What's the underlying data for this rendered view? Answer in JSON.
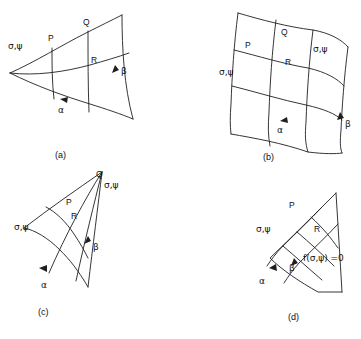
{
  "figure": {
    "title": "",
    "background_color": "#ffffff",
    "line_color": "#1f1f1f",
    "width": 361,
    "height": 339
  },
  "symbols": {
    "sigma_psi": "σ,ψ",
    "alpha": "α",
    "beta": "β",
    "point_p": "P",
    "point_q": "Q",
    "point_r": "R",
    "yield_function": "f(σ,ψ) =0"
  },
  "panels": [
    {
      "id": "a",
      "caption": "(a)",
      "description": "curvilinear net with two alpha lines and three beta lines, apex at left",
      "labels": [
        {
          "name": "sigma-psi-left",
          "text": "σ,ψ",
          "x": 14,
          "y": 46
        },
        {
          "name": "point-p",
          "text": "P",
          "x": 50,
          "y": 37
        },
        {
          "name": "point-q",
          "text": "Q",
          "x": 85,
          "y": 22
        },
        {
          "name": "point-r",
          "text": "R",
          "x": 90,
          "y": 60
        },
        {
          "name": "beta-label",
          "text": "β",
          "x": 120,
          "y": 70
        },
        {
          "name": "alpha-label",
          "text": "α",
          "x": 61,
          "y": 109
        }
      ]
    },
    {
      "id": "b",
      "caption": "(b)",
      "description": "regular 3x3 curvilinear quadrilateral net",
      "labels": [
        {
          "name": "point-q",
          "text": "Q",
          "x": 283,
          "y": 32
        },
        {
          "name": "point-p",
          "text": "P",
          "x": 247,
          "y": 45
        },
        {
          "name": "sigma-psi-right",
          "text": "σ,ψ",
          "x": 317,
          "y": 49
        },
        {
          "name": "point-r",
          "text": "R",
          "x": 287,
          "y": 62
        },
        {
          "name": "sigma-psi-left",
          "text": "σ,ψ",
          "x": 224,
          "y": 72
        },
        {
          "name": "beta-label",
          "text": "β",
          "x": 341,
          "y": 124
        },
        {
          "name": "alpha-label",
          "text": "α",
          "x": 280,
          "y": 129
        }
      ]
    },
    {
      "id": "c",
      "caption": "(c)",
      "description": "degenerate fan net converging to single point Q at upper right",
      "labels": [
        {
          "name": "point-q",
          "text": "Q",
          "x": 98,
          "y": 175
        },
        {
          "name": "sigma-psi-right",
          "text": "σ,ψ",
          "x": 107,
          "y": 185
        },
        {
          "name": "point-p",
          "text": "P",
          "x": 68,
          "y": 202
        },
        {
          "name": "point-r",
          "text": "R",
          "x": 73,
          "y": 216
        },
        {
          "name": "sigma-psi-left",
          "text": "σ,ψ",
          "x": 19,
          "y": 227
        },
        {
          "name": "beta-label",
          "text": "β",
          "x": 92,
          "y": 246
        },
        {
          "name": "alpha-label",
          "text": "α",
          "x": 44,
          "y": 284
        }
      ]
    },
    {
      "id": "d",
      "caption": "(d)",
      "description": "net bounded on the right by the yield locus f(sigma,psi)=0",
      "labels": [
        {
          "name": "point-p",
          "text": "P",
          "x": 291,
          "y": 205
        },
        {
          "name": "sigma-psi-left",
          "text": "σ,ψ",
          "x": 262,
          "y": 229
        },
        {
          "name": "point-r",
          "text": "R",
          "x": 316,
          "y": 229
        },
        {
          "name": "yield-locus-label",
          "text": "f(σ,ψ) =0",
          "x": 320,
          "y": 258
        },
        {
          "name": "beta-label",
          "text": "β",
          "x": 291,
          "y": 267
        },
        {
          "name": "alpha-label",
          "text": "α",
          "x": 262,
          "y": 280
        }
      ]
    }
  ],
  "captions": [
    {
      "id": "a",
      "text": "(a)",
      "x": 58,
      "y": 155
    },
    {
      "id": "b",
      "text": "(b)",
      "x": 265,
      "y": 157
    },
    {
      "id": "c",
      "text": "(c)",
      "x": 41,
      "y": 312
    },
    {
      "id": "d",
      "text": "(d)",
      "x": 290,
      "y": 317
    }
  ]
}
